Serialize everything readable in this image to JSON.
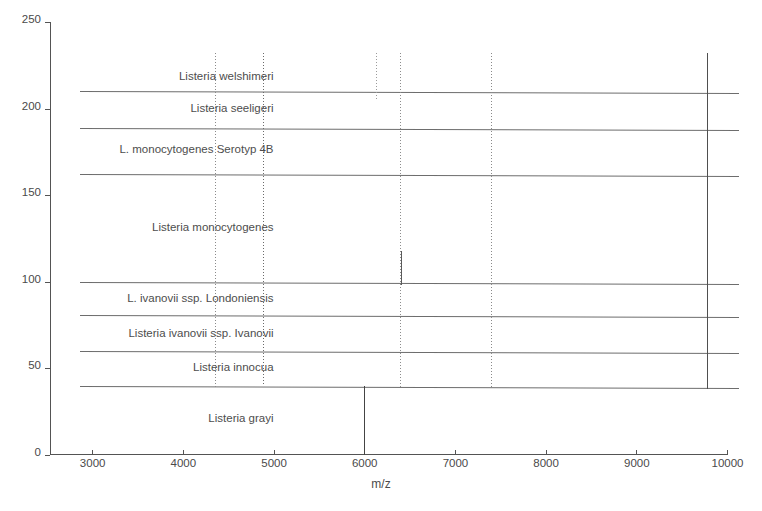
{
  "chart_data": {
    "type": "bar",
    "title": "",
    "subtitle": "",
    "xlabel": "m/z",
    "ylabel": "",
    "xlim": [
      2535,
      10000
    ],
    "ylim": [
      0,
      250
    ],
    "grid": false,
    "legend": "none",
    "x_ticks": [
      3000,
      4000,
      5000,
      6000,
      7000,
      8000,
      9000,
      10000
    ],
    "x_tick_labels": [
      "3000",
      "4000",
      "5000",
      "6000",
      "7000",
      "8000",
      "9000",
      "10000"
    ],
    "y_ticks": [
      0,
      50,
      100,
      150,
      200,
      250
    ],
    "y_tick_labels": [
      "0",
      "50",
      "100",
      "150",
      "200",
      "250"
    ],
    "species_bands": [
      {
        "name": "Listeria welshimeri",
        "label_y": 218,
        "label_x_right": 5000,
        "band_top": 230,
        "band_bottom": 210
      },
      {
        "name": "Listeria seeligeri",
        "label_y": 200,
        "label_x_right": 5000,
        "band_top": 210,
        "band_bottom": 189
      },
      {
        "name": "L. monocytogenes Serotyp 4B",
        "label_y": 176,
        "label_x_right": 5000,
        "band_top": 189,
        "band_bottom": 162
      },
      {
        "name": "Listeria monocytogenes",
        "label_y": 131,
        "label_x_right": 5000,
        "band_top": 162,
        "band_bottom": 100
      },
      {
        "name": "L. ivanovii ssp. Londoniensis",
        "label_y": 90,
        "label_x_right": 5000,
        "band_top": 100,
        "band_bottom": 81
      },
      {
        "name": "Listeria ivanovii ssp. Ivanovii",
        "label_y": 70,
        "label_x_right": 5000,
        "band_top": 81,
        "band_bottom": 60
      },
      {
        "name": "Listeria innocua",
        "label_y": 50,
        "label_x_right": 5000,
        "band_top": 60,
        "band_bottom": 40
      },
      {
        "name": "Listeria grayi",
        "label_y": 21,
        "label_x_right": 5000,
        "band_top": 40,
        "band_bottom": 0
      }
    ],
    "band_separator_lines_y": [
      210,
      189,
      162,
      100,
      81,
      60,
      40
    ],
    "band_line_x_start": 2870,
    "peaks": [
      {
        "mz": 4350,
        "y_top": 232,
        "y_bottom": 38,
        "style": "dotted",
        "color": "#8a8a8a"
      },
      {
        "mz": 4880,
        "y_top": 232,
        "y_bottom": 40,
        "style": "dotted",
        "color": "#6a6a6a"
      },
      {
        "mz": 6000,
        "y_top": 40,
        "y_bottom": 0,
        "style": "solid",
        "color": "#444444"
      },
      {
        "mz": 6130,
        "y_top": 232,
        "y_bottom": 205,
        "style": "dotted",
        "color": "#9b9b9b"
      },
      {
        "mz": 6390,
        "y_top": 232,
        "y_bottom": 38,
        "style": "dotted",
        "color": "#8d8d8d"
      },
      {
        "mz": 6400,
        "y_top": 118,
        "y_bottom": 98,
        "style": "solid",
        "color": "#5a5a5a"
      },
      {
        "mz": 7400,
        "y_top": 232,
        "y_bottom": 38,
        "style": "dotted",
        "color": "#8a8a8a"
      },
      {
        "mz": 9780,
        "y_top": 232,
        "y_bottom": 38,
        "style": "solid",
        "color": "#4f4f4f"
      }
    ]
  }
}
